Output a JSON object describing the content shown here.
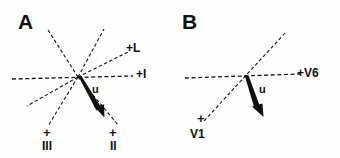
{
  "figure": {
    "background": "#fefefe",
    "ink": "#111111",
    "panels": [
      {
        "id": "A",
        "letter": "A",
        "origin": {
          "x": 78,
          "y": 77
        },
        "vector": {
          "label": "u",
          "label_x": 92,
          "label_y": 85,
          "tip": {
            "x": 102,
            "y": 115
          },
          "style": "solid-bold-arrow"
        },
        "axes": [
          {
            "name": "lead-I",
            "label": "+I",
            "label_x": 136,
            "label_y": 70,
            "end": {
              "x": 133,
              "y": 76
            },
            "start": {
              "x": 12,
              "y": 79
            },
            "style": "dashed"
          },
          {
            "name": "lead-L",
            "label": "+L",
            "label_x": 126,
            "label_y": 44,
            "end": {
              "x": 128,
              "y": 52
            },
            "start": {
              "x": 78,
              "y": 77
            },
            "style": "dashed"
          },
          {
            "name": "lead-II",
            "label": "II",
            "label_x": 110,
            "label_y": 140,
            "plus_x": 110,
            "plus_y": 127,
            "end": {
              "x": 119,
              "y": 126
            },
            "start": {
              "x": 78,
              "y": 77
            },
            "style": "dashed"
          },
          {
            "name": "lead-III",
            "label": "III",
            "label_x": 42,
            "label_y": 140,
            "plus_x": 44,
            "plus_y": 127,
            "end": {
              "x": 48,
              "y": 126
            },
            "start": {
              "x": 78,
              "y": 77
            },
            "style": "dashed"
          },
          {
            "name": "lead-aVR",
            "label": "",
            "end": {
              "x": 27,
              "y": 106
            },
            "start": {
              "x": 78,
              "y": 77
            },
            "style": "dashed"
          },
          {
            "name": "lead-aVF-upper",
            "label": "",
            "end": {
              "x": 48,
              "y": 30
            },
            "start": {
              "x": 78,
              "y": 77
            },
            "style": "dashed"
          },
          {
            "name": "lead-negII-upper",
            "label": "",
            "end": {
              "x": 104,
              "y": 29
            },
            "start": {
              "x": 78,
              "y": 77
            },
            "style": "dashed"
          }
        ]
      },
      {
        "id": "B",
        "letter": "B",
        "origin": {
          "x": 245,
          "y": 76
        },
        "vector": {
          "label": "u",
          "label_x": 259,
          "label_y": 84,
          "tip": {
            "x": 261,
            "y": 115
          },
          "style": "solid-bold-arrow"
        },
        "axes": [
          {
            "name": "lead-V6",
            "label": "+V6",
            "label_x": 297,
            "label_y": 67,
            "end": {
              "x": 300,
              "y": 74
            },
            "start": {
              "x": 185,
              "y": 78
            },
            "style": "dashed"
          },
          {
            "name": "lead-V1",
            "label": "V1",
            "label_x": 190,
            "label_y": 128,
            "plus_x": 198,
            "plus_y": 113,
            "end": {
              "x": 203,
              "y": 122
            },
            "start": {
              "x": 284,
              "y": 33
            },
            "style": "dashed"
          }
        ]
      }
    ]
  }
}
